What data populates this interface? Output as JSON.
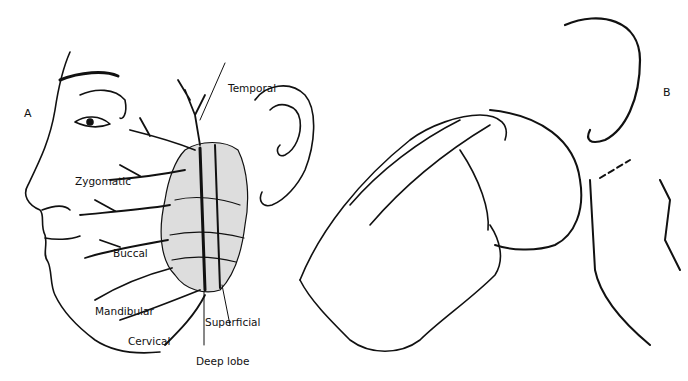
{
  "figure": {
    "panels": [
      {
        "id": "A",
        "label": "A",
        "description": "lateral face view showing facial nerve branches over parotid gland"
      },
      {
        "id": "B",
        "label": "B",
        "description": "hand palpating parotid region behind the jaw, below the ear"
      }
    ],
    "labels": {
      "temporal": "Temporal",
      "zygomatic": "Zygomatic",
      "buccal": "Buccal",
      "mandibular": "Mandibular",
      "cervical": "Cervical",
      "superficial": "Superficial",
      "deep_lobe": "Deep lobe"
    }
  }
}
